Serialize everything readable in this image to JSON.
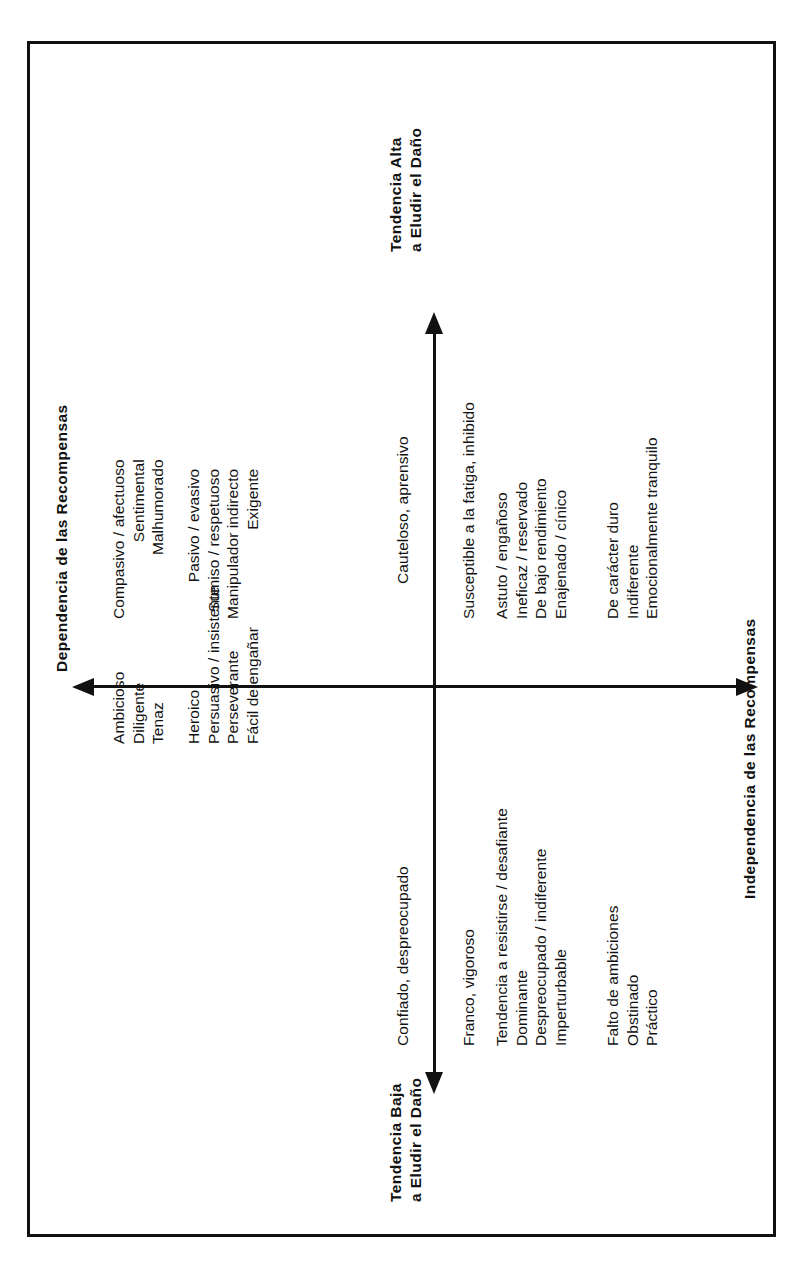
{
  "diagram": {
    "axes": {
      "vertical": {
        "high_label_line1": "Tendencia Alta",
        "high_label_line2": "a Eludir el Daño",
        "low_label_line1": "Tendencia Baja",
        "low_label_line2": "a Eludir el Daño"
      },
      "horizontal": {
        "left_label": "Dependencia de las Recompensas",
        "right_label": "Independencia de las Recompensas"
      }
    },
    "axis_pole_descriptors": {
      "top_of_vertical_axis": "Cauteloso, aprensivo",
      "bottom_of_vertical_axis": "Confiado, despreocupado"
    },
    "quadrants": {
      "upper_left": {
        "group_a": [
          "Compasivo / afectuoso",
          "Sentimental",
          "Malhumorado"
        ],
        "group_b": [
          "Pasivo / evasivo",
          "Sumiso / respetuoso",
          "Manipulador indirecto",
          "Exigente"
        ]
      },
      "upper_right": {
        "group_a": [
          "Susceptible a la fatiga, inhibido"
        ],
        "group_b": [
          "Astuto / engañoso",
          "Ineficaz / reservado",
          "De bajo rendimiento",
          "Enajenado / cínico"
        ],
        "group_c": [
          "De carácter duro",
          "Indiferente",
          "Emocionalmente tranquilo"
        ]
      },
      "lower_left": {
        "group_a": [
          "Ambicioso",
          "Diligente",
          "Tenaz"
        ],
        "group_b": [
          "Heroico",
          "Persuasivo / insistente",
          "Perseverante",
          "Fácil de engañar"
        ]
      },
      "lower_right": {
        "group_a": [
          "Franco, vigoroso"
        ],
        "group_b": [
          "Tendencia a resistirse / desafiante",
          "Dominante",
          "Despreocupado / indiferente",
          "Imperturbable"
        ],
        "group_c": [
          "Falto de ambiciones",
          "Obstinado",
          "Práctico"
        ]
      }
    },
    "colors": {
      "ink": "#111111",
      "background": "#ffffff"
    }
  }
}
